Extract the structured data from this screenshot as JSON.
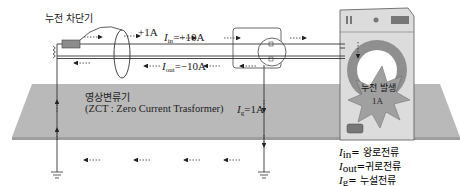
{
  "labels": {
    "breaker": "누전 차단기",
    "plus_1a": "+1A",
    "i_in_sym": "I",
    "i_in_sub": "in",
    "i_in_val": "=+10A",
    "i_out_sym": "I",
    "i_out_sub": "out",
    "i_out_val": "=−10A",
    "zct_kr": "영상변류기",
    "zct_en": "(ZCT : Zero Current Trasformer)",
    "ig_sym": "I",
    "ig_sub": "g",
    "ig_val": "=1A",
    "leak_title": "누전 발생",
    "leak_val": "1A"
  },
  "legend": [
    {
      "sym": "I",
      "sub": "in",
      "eq": "= ",
      "desc": "왕로전류"
    },
    {
      "sym": "I",
      "sub": "out",
      "eq": "=",
      "desc": "귀로전류"
    },
    {
      "sym": "I",
      "sub": "g",
      "eq": "= ",
      "desc": "누설전류"
    }
  ],
  "colors": {
    "ground_plane": "#b8b8b8",
    "breaker_box": "#8c8c8c",
    "washer_body": "#d9d9d9",
    "drum_ring": "#8f8f8f",
    "burst": "#9a9a9a",
    "line": "#333333"
  }
}
